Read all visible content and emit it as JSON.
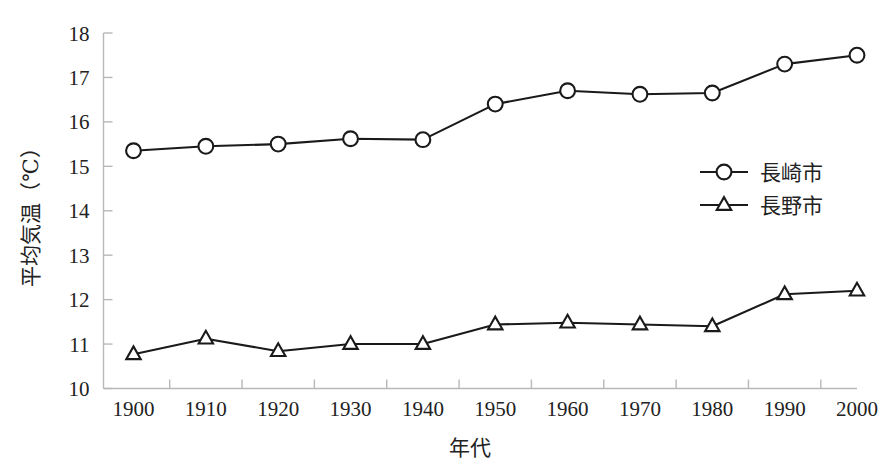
{
  "chart_data": {
    "type": "line",
    "title": "",
    "xlabel": "年代",
    "ylabel": "平均気温（℃）",
    "x": [
      1900,
      1910,
      1920,
      1930,
      1940,
      1950,
      1960,
      1970,
      1980,
      1990,
      2000
    ],
    "categories": [
      "1900",
      "1910",
      "1920",
      "1930",
      "1940",
      "1950",
      "1960",
      "1970",
      "1980",
      "1990",
      "2000"
    ],
    "xlim": [
      1900,
      2000
    ],
    "ylim": [
      10,
      18
    ],
    "ytick_labels": [
      "10",
      "11",
      "12",
      "13",
      "14",
      "15",
      "16",
      "17",
      "18"
    ],
    "yticks": [
      10,
      11,
      12,
      13,
      14,
      15,
      16,
      17,
      18
    ],
    "grid": false,
    "legend_position": "right-middle",
    "series": [
      {
        "name": "長崎市",
        "marker": "circle",
        "values": [
          15.35,
          15.45,
          15.5,
          15.62,
          15.6,
          16.4,
          16.7,
          16.62,
          16.65,
          17.3,
          17.5
        ]
      },
      {
        "name": "長野市",
        "marker": "triangle",
        "values": [
          10.77,
          11.12,
          10.84,
          11.0,
          11.0,
          11.44,
          11.48,
          11.44,
          11.4,
          12.12,
          12.2
        ]
      }
    ]
  },
  "legend": {
    "items": [
      {
        "label": "長崎市",
        "marker": "circle"
      },
      {
        "label": "長野市",
        "marker": "triangle"
      }
    ]
  },
  "axes": {
    "y_title": "平均気温（℃）",
    "x_title": "年代"
  },
  "colors": {
    "line": "#1a1a1a",
    "axis": "#b8b8b8",
    "marker_fill": "#ffffff",
    "background": "#ffffff"
  }
}
